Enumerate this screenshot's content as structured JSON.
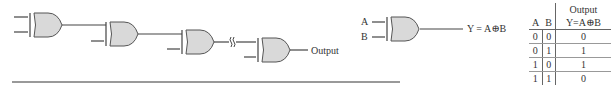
{
  "cascade": {
    "output_label": "Output",
    "gate_type": "XOR",
    "gate_count_visible": 4,
    "break_symbol": "wavy-break"
  },
  "single_gate": {
    "input_a": "A",
    "input_b": "B",
    "expression": "Y = A⊕B"
  },
  "truth_table": {
    "header_output": "Output",
    "columns": [
      "A",
      "B",
      "Y=A⊕B"
    ],
    "rows": [
      [
        "0",
        "0",
        "0"
      ],
      [
        "0",
        "1",
        "1"
      ],
      [
        "1",
        "0",
        "1"
      ],
      [
        "1",
        "1",
        "0"
      ]
    ]
  },
  "colors": {
    "gate_fill": "#d9d9d9",
    "line": "#444444",
    "rule": "#777777"
  }
}
